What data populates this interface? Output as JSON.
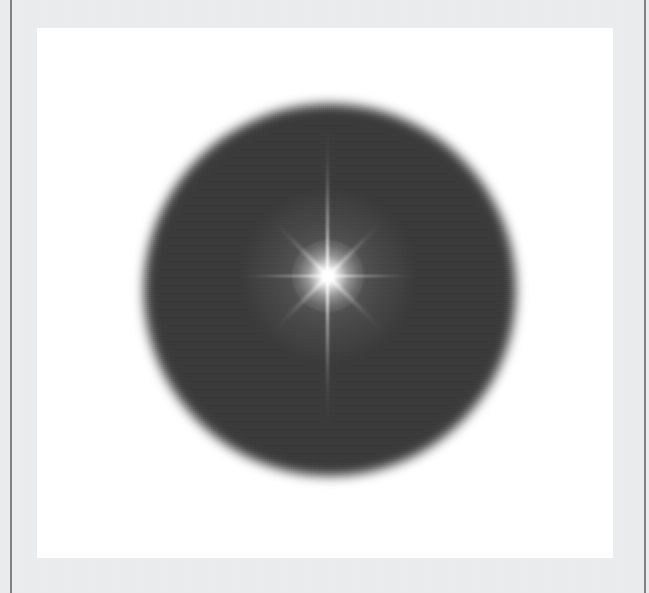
{
  "document": {
    "title": "Starburst Diffraction Image",
    "width": 649,
    "height": 593
  },
  "frame": {
    "name": "outer-frame",
    "background_color": "#ecedee",
    "rule_color": "#6f6f6f",
    "rules": [
      {
        "name": "left-rule",
        "x": 10,
        "width": 2
      },
      {
        "name": "right-rule",
        "x": 644,
        "width": 2
      }
    ]
  },
  "image_panel": {
    "name": "image-panel",
    "background_color": "#ffffff",
    "x": 37,
    "y": 28,
    "width": 576,
    "height": 530
  },
  "figure": {
    "disc": {
      "name": "dark-disc",
      "center_x": 330,
      "center_y": 290,
      "radius": 186,
      "fill_color": "#3a3a3a",
      "edge": "soft blurred falloff to white",
      "blur_px": 6
    },
    "starburst": {
      "name": "starburst",
      "center_x": 328,
      "center_y": 276,
      "core_color": "#ffffff",
      "point_count": 8,
      "spikes": [
        {
          "name": "spike-vertical",
          "angle_deg": 90,
          "length_px": 300,
          "relative_intensity": 1.0
        },
        {
          "name": "spike-horizontal",
          "angle_deg": 0,
          "length_px": 186,
          "relative_intensity": 0.82
        },
        {
          "name": "spike-diagonal-ne-sw",
          "angle_deg": -45,
          "length_px": 150,
          "relative_intensity": 0.66
        },
        {
          "name": "spike-diagonal-nw-se",
          "angle_deg": 45,
          "length_px": 150,
          "relative_intensity": 0.66
        }
      ],
      "core_radius_px": 36,
      "halo_radius_px": 80
    }
  }
}
